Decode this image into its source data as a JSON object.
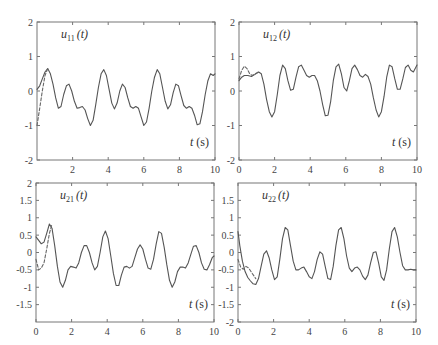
{
  "chart_data": [
    {
      "type": "line",
      "title": "u11(t)",
      "label_main": "u",
      "label_sub": "11",
      "label_arg": "(t)",
      "xlabel": "t (s)",
      "xlim": [
        0,
        10
      ],
      "ylim": [
        -2,
        2
      ],
      "xticks": [
        2,
        4,
        6,
        8,
        10
      ],
      "yticks": [
        -2,
        -1,
        0,
        1,
        2
      ],
      "box": {
        "x0": 37,
        "y0": 22,
        "x1": 215,
        "y1": 160
      },
      "series": [
        {
          "name": "actual",
          "style": "solid",
          "x": [
            0,
            0.15,
            0.3,
            0.45,
            0.6,
            0.75,
            0.9,
            1.05,
            1.2,
            1.35,
            1.5,
            1.65,
            1.8,
            1.95,
            2.1,
            2.25,
            2.4,
            2.55,
            2.7,
            2.85,
            3.0,
            3.15,
            3.3,
            3.45,
            3.6,
            3.75,
            3.9,
            4.05,
            4.2,
            4.35,
            4.5,
            4.65,
            4.8,
            4.95,
            5.1,
            5.25,
            5.4,
            5.55,
            5.7,
            5.85,
            6.0,
            6.15,
            6.3,
            6.45,
            6.6,
            6.75,
            6.9,
            7.05,
            7.2,
            7.35,
            7.5,
            7.65,
            7.8,
            7.95,
            8.1,
            8.25,
            8.4,
            8.55,
            8.7,
            8.85,
            9.0,
            9.15,
            9.3,
            9.45,
            9.6,
            9.75,
            9.9,
            10
          ],
          "y": [
            0.05,
            0.15,
            0.35,
            0.55,
            0.65,
            0.5,
            0.2,
            -0.2,
            -0.5,
            -0.45,
            -0.1,
            0.15,
            0.2,
            0.0,
            -0.3,
            -0.5,
            -0.48,
            -0.45,
            -0.55,
            -0.8,
            -1.0,
            -0.85,
            -0.4,
            0.1,
            0.5,
            0.62,
            0.45,
            0.05,
            -0.35,
            -0.52,
            -0.35,
            0.0,
            0.2,
            0.1,
            -0.2,
            -0.45,
            -0.5,
            -0.45,
            -0.5,
            -0.75,
            -1.0,
            -0.9,
            -0.5,
            0.0,
            0.4,
            0.62,
            0.5,
            0.1,
            -0.3,
            -0.52,
            -0.4,
            -0.05,
            0.2,
            0.15,
            -0.15,
            -0.42,
            -0.5,
            -0.45,
            -0.5,
            -0.7,
            -0.98,
            -0.95,
            -0.6,
            -0.1,
            0.3,
            0.5,
            0.45,
            0.5
          ]
        },
        {
          "name": "reference",
          "style": "dashed",
          "x": [
            0,
            0.15,
            0.3,
            0.45,
            0.6
          ],
          "y": [
            -1.0,
            -0.5,
            0.0,
            0.45,
            0.65
          ]
        }
      ]
    },
    {
      "type": "line",
      "title": "u12(t)",
      "label_main": "u",
      "label_sub": "12",
      "label_arg": "(t)",
      "xlabel": "t (s)",
      "xlim": [
        0,
        10
      ],
      "ylim": [
        -2,
        2
      ],
      "xticks": [
        0,
        2,
        4,
        6,
        8,
        10
      ],
      "yticks": [
        -2,
        -1,
        0,
        1,
        2
      ],
      "box": {
        "x0": 239,
        "y0": 22,
        "x1": 417,
        "y1": 160
      },
      "series": [
        {
          "name": "actual",
          "style": "solid",
          "x": [
            0,
            0.15,
            0.3,
            0.5,
            0.7,
            0.9,
            1.1,
            1.25,
            1.4,
            1.55,
            1.7,
            1.85,
            2.0,
            2.15,
            2.3,
            2.45,
            2.6,
            2.75,
            2.9,
            3.05,
            3.2,
            3.35,
            3.5,
            3.65,
            3.8,
            3.95,
            4.1,
            4.25,
            4.4,
            4.55,
            4.7,
            4.85,
            5.0,
            5.15,
            5.3,
            5.45,
            5.6,
            5.75,
            5.9,
            6.05,
            6.2,
            6.35,
            6.5,
            6.65,
            6.8,
            6.95,
            7.1,
            7.25,
            7.4,
            7.55,
            7.7,
            7.85,
            8.0,
            8.15,
            8.3,
            8.45,
            8.6,
            8.75,
            8.9,
            9.05,
            9.2,
            9.35,
            9.5,
            9.65,
            9.8,
            9.95,
            10
          ],
          "y": [
            0.3,
            0.4,
            0.45,
            0.45,
            0.42,
            0.48,
            0.55,
            0.5,
            0.2,
            -0.25,
            -0.6,
            -0.75,
            -0.6,
            -0.1,
            0.45,
            0.75,
            0.65,
            0.3,
            0.02,
            0.05,
            0.4,
            0.7,
            0.75,
            0.6,
            0.45,
            0.4,
            0.45,
            0.45,
            0.3,
            0.0,
            -0.4,
            -0.72,
            -0.7,
            -0.3,
            0.3,
            0.7,
            0.78,
            0.5,
            0.1,
            0.0,
            0.3,
            0.65,
            0.75,
            0.62,
            0.45,
            0.4,
            0.48,
            0.42,
            0.2,
            -0.2,
            -0.55,
            -0.75,
            -0.6,
            -0.15,
            0.4,
            0.75,
            0.7,
            0.35,
            0.05,
            0.05,
            0.35,
            0.68,
            0.75,
            0.6,
            0.55,
            0.7,
            0.75
          ]
        },
        {
          "name": "reference",
          "style": "dashed",
          "x": [
            0,
            0.15,
            0.3,
            0.45,
            0.6,
            0.75,
            0.9,
            1.1
          ],
          "y": [
            0.35,
            0.6,
            0.72,
            0.65,
            0.5,
            0.45,
            0.5,
            0.55
          ]
        }
      ]
    },
    {
      "type": "line",
      "title": "u21(t)",
      "label_main": "u",
      "label_sub": "21",
      "label_arg": "(t)",
      "xlabel": "t (s)",
      "xlim": [
        0,
        10
      ],
      "ylim": [
        -2,
        2
      ],
      "xticks": [
        0,
        2,
        4,
        6,
        8,
        10
      ],
      "yticks": [
        -1.5,
        -1,
        -0.5,
        0,
        0.5,
        1,
        1.5,
        2
      ],
      "box": {
        "x0": 36,
        "y0": 183,
        "x1": 214,
        "y1": 322
      },
      "series": [
        {
          "name": "actual",
          "style": "solid",
          "x": [
            0,
            0.15,
            0.3,
            0.45,
            0.6,
            0.75,
            0.9,
            1.05,
            1.2,
            1.35,
            1.5,
            1.65,
            1.8,
            1.95,
            2.1,
            2.25,
            2.4,
            2.55,
            2.7,
            2.85,
            3.0,
            3.15,
            3.3,
            3.45,
            3.6,
            3.75,
            3.9,
            4.05,
            4.2,
            4.35,
            4.5,
            4.65,
            4.8,
            4.95,
            5.1,
            5.25,
            5.4,
            5.55,
            5.7,
            5.85,
            6.0,
            6.15,
            6.3,
            6.45,
            6.6,
            6.75,
            6.9,
            7.05,
            7.2,
            7.35,
            7.5,
            7.65,
            7.8,
            7.95,
            8.1,
            8.25,
            8.4,
            8.55,
            8.7,
            8.85,
            9.0,
            9.15,
            9.3,
            9.45,
            9.6,
            9.75,
            9.9,
            10
          ],
          "y": [
            0.45,
            0.35,
            0.25,
            0.3,
            0.55,
            0.82,
            0.7,
            0.2,
            -0.4,
            -0.85,
            -1.0,
            -0.8,
            -0.5,
            -0.4,
            -0.42,
            -0.45,
            -0.3,
            0.0,
            0.2,
            0.2,
            0.0,
            -0.3,
            -0.5,
            -0.4,
            0.0,
            0.45,
            0.62,
            0.4,
            -0.1,
            -0.6,
            -0.95,
            -0.95,
            -0.65,
            -0.42,
            -0.4,
            -0.45,
            -0.4,
            -0.15,
            0.1,
            0.22,
            0.1,
            -0.2,
            -0.45,
            -0.48,
            -0.2,
            0.25,
            0.6,
            0.55,
            0.15,
            -0.35,
            -0.8,
            -1.0,
            -0.85,
            -0.55,
            -0.42,
            -0.42,
            -0.45,
            -0.3,
            -0.05,
            0.18,
            0.2,
            0.0,
            -0.3,
            -0.48,
            -0.5,
            -0.35,
            -0.15,
            -0.1
          ]
        },
        {
          "name": "reference",
          "style": "dashed",
          "x": [
            0,
            0.15,
            0.3,
            0.45,
            0.6,
            0.75,
            0.9
          ],
          "y": [
            -0.2,
            -0.5,
            -0.45,
            -0.3,
            0.1,
            0.55,
            0.82
          ]
        }
      ]
    },
    {
      "type": "line",
      "title": "u22(t)",
      "label_main": "u",
      "label_sub": "22",
      "label_arg": "(t)",
      "xlabel": "t (s)",
      "xlim": [
        0,
        10
      ],
      "ylim": [
        -2,
        2
      ],
      "xticks": [
        0,
        2,
        4,
        6,
        8,
        10
      ],
      "yticks": [
        -2,
        -1.5,
        -1,
        -0.5,
        0,
        0.5,
        1,
        1.5
      ],
      "box": {
        "x0": 238,
        "y0": 183,
        "x1": 416,
        "y1": 322
      },
      "series": [
        {
          "name": "actual",
          "style": "solid",
          "x": [
            0,
            0.1,
            0.25,
            0.4,
            0.55,
            0.7,
            0.85,
            1.0,
            1.15,
            1.3,
            1.45,
            1.6,
            1.75,
            1.9,
            2.05,
            2.2,
            2.35,
            2.5,
            2.65,
            2.8,
            2.95,
            3.1,
            3.25,
            3.4,
            3.55,
            3.7,
            3.85,
            4.0,
            4.15,
            4.3,
            4.45,
            4.6,
            4.75,
            4.9,
            5.05,
            5.2,
            5.35,
            5.5,
            5.65,
            5.8,
            5.95,
            6.1,
            6.25,
            6.4,
            6.55,
            6.7,
            6.85,
            7.0,
            7.15,
            7.3,
            7.45,
            7.6,
            7.75,
            7.9,
            8.05,
            8.2,
            8.35,
            8.5,
            8.65,
            8.8,
            8.95,
            9.1,
            9.25,
            9.4,
            9.55,
            9.7,
            9.85,
            10
          ],
          "y": [
            0.6,
            0.2,
            -0.25,
            -0.55,
            -0.72,
            -0.82,
            -0.9,
            -0.92,
            -0.75,
            -0.4,
            -0.05,
            0.05,
            -0.15,
            -0.5,
            -0.78,
            -0.7,
            -0.2,
            0.4,
            0.72,
            0.65,
            0.2,
            -0.25,
            -0.5,
            -0.5,
            -0.45,
            -0.42,
            -0.55,
            -0.7,
            -0.75,
            -0.55,
            -0.2,
            0.02,
            -0.05,
            -0.4,
            -0.75,
            -0.78,
            -0.4,
            0.2,
            0.65,
            0.72,
            0.4,
            -0.1,
            -0.45,
            -0.55,
            -0.45,
            -0.42,
            -0.5,
            -0.68,
            -0.78,
            -0.65,
            -0.3,
            0.0,
            0.02,
            -0.3,
            -0.7,
            -0.8,
            -0.5,
            0.1,
            0.6,
            0.72,
            0.45,
            0.0,
            -0.38,
            -0.5,
            -0.5,
            -0.48,
            -0.5,
            -0.5
          ]
        },
        {
          "name": "reference",
          "style": "dashed",
          "x": [
            0,
            0.15,
            0.3,
            0.45,
            0.6,
            0.8,
            1.0
          ],
          "y": [
            -0.2,
            -0.42,
            -0.48,
            -0.4,
            -0.45,
            -0.6,
            -0.75
          ]
        }
      ]
    }
  ]
}
